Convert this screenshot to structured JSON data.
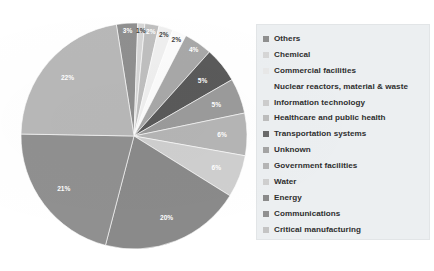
{
  "chart_data": {
    "type": "pie",
    "title": "",
    "subtitle": "",
    "xlabel": "",
    "ylabel": "",
    "legend_position": "right",
    "grid": false,
    "value_suffix": "%",
    "categories": [
      "Others",
      "Chemical",
      "Commercial facilities",
      "Nuclear reactors, material & waste",
      "Information technology",
      "Healthcare and public health",
      "Transportation systems",
      "Unknown",
      "Government facilities",
      "Water",
      "Energy",
      "Communications",
      "Critical manufacturing"
    ],
    "values": [
      3,
      1,
      2,
      2,
      2,
      4,
      5,
      5,
      6,
      6,
      20,
      21,
      22
    ],
    "labels": [
      "3%",
      "1%",
      "2%",
      "2%",
      "2%",
      "4%",
      "5%",
      "5%",
      "6%",
      "6%",
      "20%",
      "21%",
      "22%"
    ],
    "colors": [
      "#8f8f8f",
      "#d6d6d6",
      "#bfbfbf",
      "#efefef",
      "#fbfbfb",
      "#a8a8a8",
      "#5a5a5a",
      "#9b9b9b",
      "#b5b5b5",
      "#cfcfcf",
      "#8a8a8a",
      "#909090",
      "#b8b8b8"
    ]
  },
  "legend": {
    "items": [
      {
        "label": "Others",
        "color": "#8f8f8f",
        "swatch_visible": true
      },
      {
        "label": "Chemical",
        "color": "#d6d6d6",
        "swatch_visible": true
      },
      {
        "label": "Commercial facilities",
        "color": "#e8e8e8",
        "swatch_visible": true
      },
      {
        "label": "Nuclear reactors, material & waste",
        "color": "#fbfbfb",
        "swatch_visible": false
      },
      {
        "label": "Information technology",
        "color": "#cdcdcd",
        "swatch_visible": true
      },
      {
        "label": "Healthcare and public health",
        "color": "#bdbdbd",
        "swatch_visible": true
      },
      {
        "label": "Transportation systems",
        "color": "#6a6a6a",
        "swatch_visible": true
      },
      {
        "label": "Unknown",
        "color": "#a4a4a4",
        "swatch_visible": true
      },
      {
        "label": "Government facilities",
        "color": "#b5b5b5",
        "swatch_visible": true
      },
      {
        "label": "Water",
        "color": "#cfcfcf",
        "swatch_visible": true
      },
      {
        "label": "Energy",
        "color": "#8a8a8a",
        "swatch_visible": true
      },
      {
        "label": "Communications",
        "color": "#909090",
        "swatch_visible": true
      },
      {
        "label": "Critical manufacturing",
        "color": "#c4c4c4",
        "swatch_visible": true
      }
    ]
  },
  "theme": {
    "background": "#ffffff",
    "legend_background": "#eceff1",
    "label_text": "#ffffff",
    "legend_text": "#2e2e2e"
  }
}
